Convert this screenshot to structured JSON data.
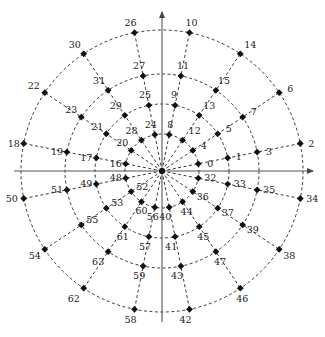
{
  "diagram": {
    "center": [
      162,
      171
    ],
    "axis_color": "#555555",
    "line_color": "#222222",
    "point_color": "#111111",
    "rings": [
      37,
      67,
      97,
      141
    ],
    "axes": {
      "x_axis": {
        "from": [
          14,
          171
        ],
        "to": [
          313,
          171
        ],
        "arrow": "right"
      },
      "y_axis": {
        "from": [
          162,
          322
        ],
        "to": [
          162,
          12
        ],
        "arrow": "up"
      }
    },
    "rays": [
      {
        "angle": 11.25,
        "labels": [
          "0",
          "1",
          "3",
          "2"
        ]
      },
      {
        "angle": 33.75,
        "labels": [
          "4",
          "5",
          "7",
          "6"
        ]
      },
      {
        "angle": 56.25,
        "labels": [
          "12",
          "13",
          "15",
          "14"
        ]
      },
      {
        "angle": 78.75,
        "labels": [
          "8",
          "9",
          "11",
          "10"
        ]
      },
      {
        "angle": 101.25,
        "labels": [
          "24",
          "25",
          "27",
          "26"
        ]
      },
      {
        "angle": 123.75,
        "labels": [
          "28",
          "29",
          "31",
          "30"
        ]
      },
      {
        "angle": 146.25,
        "labels": [
          "20",
          "21",
          "23",
          "22"
        ]
      },
      {
        "angle": 168.75,
        "labels": [
          "16",
          "17",
          "19",
          "18"
        ]
      },
      {
        "angle": 191.25,
        "labels": [
          "48",
          "49",
          "51",
          "50"
        ]
      },
      {
        "angle": 213.75,
        "labels": [
          "52",
          "53",
          "55",
          "54"
        ]
      },
      {
        "angle": 236.25,
        "labels": [
          "60",
          "61",
          "63",
          "62"
        ]
      },
      {
        "angle": 258.75,
        "labels": [
          "56",
          "57",
          "59",
          "58"
        ]
      },
      {
        "angle": 281.25,
        "labels": [
          "40",
          "41",
          "43",
          "42"
        ]
      },
      {
        "angle": 303.75,
        "labels": [
          "44",
          "45",
          "47",
          "46"
        ]
      },
      {
        "angle": 326.25,
        "labels": [
          "36",
          "37",
          "39",
          "38"
        ]
      },
      {
        "angle": 348.75,
        "labels": [
          "32",
          "33",
          "35",
          "34"
        ]
      }
    ],
    "label_offsets": {
      "0": [
        9,
        3
      ],
      "1": [
        8,
        2
      ],
      "3": [
        9,
        3
      ],
      "2": [
        8,
        3
      ],
      "4": [
        8,
        -1
      ],
      "5": [
        8,
        -2
      ],
      "7": [
        8,
        -2
      ],
      "6": [
        8,
        -1
      ],
      "12": [
        6,
        -6
      ],
      "13": [
        4,
        -6
      ],
      "15": [
        2,
        -6
      ],
      "14": [
        4,
        -6
      ],
      "8": [
        -2,
        -7
      ],
      "9": [
        -4,
        -7
      ],
      "11": [
        -4,
        -7
      ],
      "10": [
        -4,
        -7
      ],
      "24": [
        -10,
        -7
      ],
      "25": [
        -10,
        -7
      ],
      "27": [
        -10,
        -7
      ],
      "26": [
        -10,
        -7
      ],
      "28": [
        -16,
        -6
      ],
      "29": [
        -15,
        -6
      ],
      "31": [
        -15,
        -6
      ],
      "30": [
        -15,
        -6
      ],
      "20": [
        -15,
        -4
      ],
      "21": [
        -15,
        -4
      ],
      "23": [
        -16,
        -4
      ],
      "22": [
        -17,
        -4
      ],
      "16": [
        -16,
        3
      ],
      "17": [
        -16,
        3
      ],
      "19": [
        -16,
        3
      ],
      "18": [
        -16,
        3
      ],
      "48": [
        -16,
        3
      ],
      "49": [
        -16,
        3
      ],
      "51": [
        -16,
        3
      ],
      "50": [
        -18,
        3
      ],
      "52": [
        5,
        -2
      ],
      "53": [
        5,
        -2
      ],
      "55": [
        5,
        -2
      ],
      "54": [
        -16,
        10
      ],
      "60": [
        -6,
        12
      ],
      "61": [
        -8,
        13
      ],
      "63": [
        -16,
        13
      ],
      "62": [
        -16,
        14
      ],
      "56": [
        -8,
        13
      ],
      "57": [
        -10,
        13
      ],
      "59": [
        -10,
        13
      ],
      "58": [
        -10,
        14
      ],
      "40": [
        -10,
        13
      ],
      "41": [
        -10,
        13
      ],
      "43": [
        -10,
        13
      ],
      "42": [
        -10,
        14
      ],
      "44": [
        -2,
        13
      ],
      "45": [
        -2,
        13
      ],
      "47": [
        -2,
        13
      ],
      "46": [
        -4,
        14
      ],
      "36": [
        4,
        8
      ],
      "37": [
        4,
        8
      ],
      "39": [
        4,
        8
      ],
      "38": [
        4,
        10
      ],
      "32": [
        6,
        3
      ],
      "33": [
        6,
        3
      ],
      "35": [
        6,
        3
      ],
      "34": [
        6,
        3
      ]
    }
  }
}
